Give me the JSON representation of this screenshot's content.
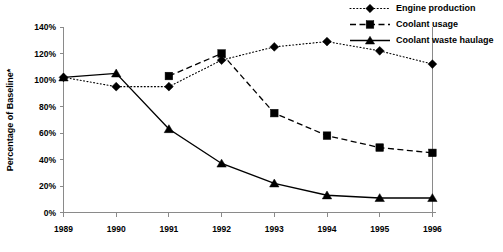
{
  "chart_data": {
    "type": "line",
    "title": "",
    "xlabel": "",
    "ylabel": "Percentage of Baseline*",
    "categories": [
      "1989",
      "1990",
      "1991",
      "1992",
      "1993",
      "1994",
      "1995",
      "1996"
    ],
    "x": [
      1989,
      1990,
      1991,
      1992,
      1993,
      1994,
      1995,
      1996
    ],
    "ylim": [
      0,
      140
    ],
    "yticks": [
      0,
      20,
      40,
      60,
      80,
      100,
      120,
      140
    ],
    "ytick_labels": [
      "0%",
      "20%",
      "40%",
      "60%",
      "80%",
      "100%",
      "120%",
      "140%"
    ],
    "grid": false,
    "legend_position": "top-right",
    "series": [
      {
        "name": "Engine production",
        "marker": "diamond",
        "line_style": "dotted",
        "color": "#000000",
        "x": [
          1989,
          1990,
          1991,
          1992,
          1993,
          1994,
          1995,
          1996
        ],
        "values": [
          102,
          95,
          95,
          115,
          125,
          129,
          122,
          112
        ]
      },
      {
        "name": "Coolant usage",
        "marker": "square",
        "line_style": "dashed",
        "color": "#000000",
        "x": [
          1991,
          1992,
          1993,
          1994,
          1995,
          1996
        ],
        "values": [
          103,
          120,
          75,
          58,
          49,
          45
        ]
      },
      {
        "name": "Coolant waste haulage",
        "marker": "triangle",
        "line_style": "solid",
        "color": "#000000",
        "x": [
          1989,
          1990,
          1991,
          1992,
          1993,
          1994,
          1995,
          1996
        ],
        "values": [
          102,
          105,
          63,
          37,
          22,
          13,
          11,
          11
        ]
      }
    ]
  },
  "legend": {
    "items": [
      {
        "label": "Engine production"
      },
      {
        "label": "Coolant usage"
      },
      {
        "label": "Coolant waste haulage"
      }
    ]
  },
  "axes": {
    "y_title": "Percentage of Baseline*",
    "y_labels": [
      "140%",
      "120%",
      "100%",
      "80%",
      "60%",
      "40%",
      "20%",
      "0%"
    ],
    "x_labels": [
      "1989",
      "1990",
      "1991",
      "1992",
      "1993",
      "1994",
      "1995",
      "1996"
    ]
  }
}
